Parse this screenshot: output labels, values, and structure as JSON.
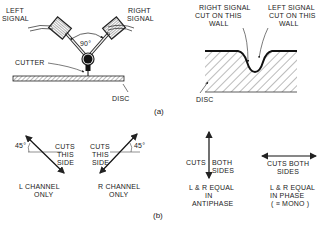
{
  "part_a": {
    "caption": "(a)",
    "cutter_head": {
      "left_signal_label": [
        "LEFT",
        "SIGNAL"
      ],
      "right_signal_label": [
        "RIGHT",
        "SIGNAL"
      ],
      "angle_label": "90°",
      "cutter_label": "CUTTER",
      "disc_label": "DISC"
    },
    "groove_section": {
      "right_wall_label": [
        "RIGHT SIGNAL",
        "CUT ON THIS",
        "WALL"
      ],
      "left_wall_label": [
        "LEFT SIGNAL",
        "CUT ON THIS",
        "WALL"
      ],
      "disc_label": "DISC"
    }
  },
  "part_b": {
    "caption": "(b)",
    "l_channel": {
      "angle_label": "45°",
      "cut_label": [
        "CUTS",
        "THIS",
        "SIDE"
      ],
      "title": [
        "L CHANNEL",
        "ONLY"
      ]
    },
    "r_channel": {
      "angle_label": "45°",
      "cut_label": [
        "CUTS",
        "THIS",
        "SIDE"
      ],
      "title": [
        "R CHANNEL",
        "ONLY"
      ]
    },
    "antiphase": {
      "cut_label_left": "CUTS",
      "cut_label_right": [
        "BOTH",
        "SIDES"
      ],
      "title": [
        "L & R EQUAL",
        "IN",
        "ANTIPHASE"
      ]
    },
    "in_phase": {
      "cut_label": [
        "CUTS BOTH",
        "SIDES"
      ],
      "title": [
        "L & R EQUAL",
        "IN  PHASE",
        "( ≡ MONO )"
      ]
    }
  }
}
